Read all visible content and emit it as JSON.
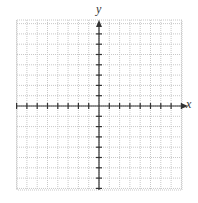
{
  "diagram": {
    "type": "coordinate-grid",
    "x_axis_label": "x",
    "y_axis_label": "y",
    "grid": {
      "left": 17,
      "top": 20,
      "right": 182,
      "bottom": 190,
      "cell": 10.3,
      "cols": 16,
      "rows": 17,
      "line_color": "#c8c8c8",
      "dotted": true
    },
    "origin": {
      "x": 99,
      "y": 106
    },
    "axis_color": "#333333",
    "ticks": {
      "x": [
        -8,
        -7,
        -6,
        -5,
        -4,
        -3,
        -2,
        -1,
        1,
        2,
        3,
        4,
        5,
        6,
        7,
        8
      ],
      "y": [
        8,
        7,
        6,
        5,
        4,
        3,
        2,
        1,
        -1,
        -2,
        -3,
        -4,
        -5,
        -6,
        -7,
        -8
      ]
    }
  }
}
